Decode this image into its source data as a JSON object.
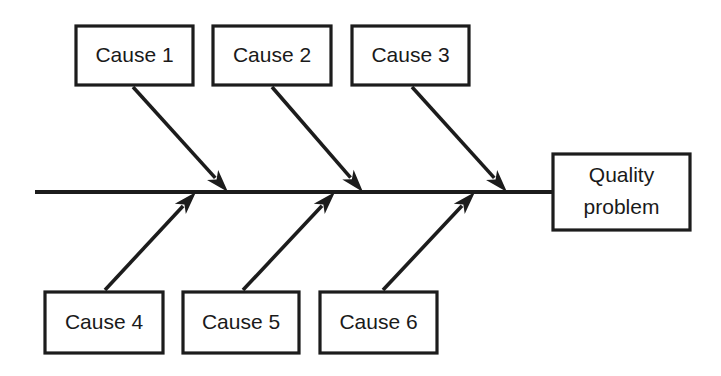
{
  "diagram": {
    "type": "fishbone-ishikawa-cause-and-effect",
    "title": "",
    "colors": {
      "stroke": "#1c1c1c",
      "background": "#ffffff",
      "text": "#1a1a1a"
    },
    "spine": {
      "x_start": 35,
      "x_end": 553,
      "y": 192
    },
    "effect": {
      "label_line_1": "Quality",
      "label_line_2": "problem",
      "box": {
        "x": 553,
        "y": 154,
        "w": 137,
        "h": 76
      }
    },
    "causes_top": [
      {
        "label": "Cause 1",
        "box": {
          "x": 76,
          "y": 26,
          "w": 117,
          "h": 59
        },
        "bone": {
          "x1": 133,
          "y1": 87,
          "x2": 228,
          "y2": 192
        }
      },
      {
        "label": "Cause 2",
        "box": {
          "x": 213,
          "y": 26,
          "w": 118,
          "h": 59
        },
        "bone": {
          "x1": 272,
          "y1": 87,
          "x2": 363,
          "y2": 192
        }
      },
      {
        "label": "Cause 3",
        "box": {
          "x": 352,
          "y": 26,
          "w": 117,
          "h": 59
        },
        "bone": {
          "x1": 412,
          "y1": 87,
          "x2": 507,
          "y2": 192
        }
      }
    ],
    "causes_bottom": [
      {
        "label": "Cause 4",
        "box": {
          "x": 45,
          "y": 292,
          "w": 118,
          "h": 61
        },
        "bone": {
          "x1": 105,
          "y1": 290,
          "x2": 196,
          "y2": 192
        }
      },
      {
        "label": "Cause 5",
        "box": {
          "x": 183,
          "y": 292,
          "w": 116,
          "h": 61
        },
        "bone": {
          "x1": 243,
          "y1": 290,
          "x2": 335,
          "y2": 192
        }
      },
      {
        "label": "Cause 6",
        "box": {
          "x": 320,
          "y": 292,
          "w": 117,
          "h": 61
        },
        "bone": {
          "x1": 383,
          "y1": 290,
          "x2": 475,
          "y2": 192
        }
      }
    ]
  }
}
